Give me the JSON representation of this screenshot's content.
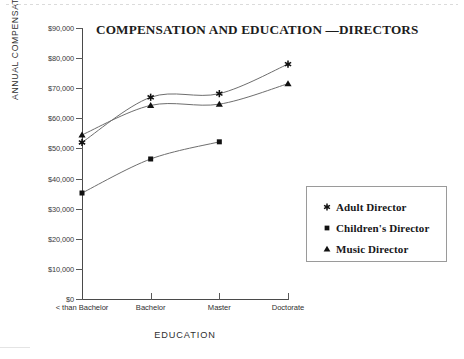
{
  "chart_data": {
    "type": "line",
    "title": "COMPENSATION AND EDUCATION —DIRECTORS",
    "xlabel": "EDUCATION",
    "ylabel": "ANNUAL COMPENSATION",
    "categories": [
      "< than Bachelor",
      "Bachelor",
      "Master",
      "Doctorate"
    ],
    "ylim": [
      0,
      90000
    ],
    "yticks": [
      0,
      10000,
      20000,
      30000,
      40000,
      50000,
      60000,
      70000,
      80000,
      90000
    ],
    "ytick_labels": [
      "$0",
      "$10,000",
      "$20,000",
      "$30,000",
      "$40,000",
      "$50,000",
      "$60,000",
      "$70,000",
      "$80,000",
      "$90,000"
    ],
    "grid": false,
    "legend_position": "right",
    "smoothed": true,
    "series": [
      {
        "name": "Adult Director",
        "marker": "star",
        "values": [
          52000,
          67000,
          68200,
          78000
        ]
      },
      {
        "name": "Children's Director",
        "marker": "square",
        "values": [
          35200,
          46500,
          52200,
          null
        ]
      },
      {
        "name": "Music Director",
        "marker": "triangle",
        "values": [
          54500,
          64300,
          64700,
          71500
        ]
      }
    ]
  },
  "legend": {
    "items": [
      {
        "label": "Adult Director",
        "marker": "star-marker-icon"
      },
      {
        "label": "Children's Director",
        "marker": "square-marker-icon"
      },
      {
        "label": "Music Director",
        "marker": "triangle-marker-icon"
      }
    ]
  },
  "colors": {
    "line": "#6e6e6e",
    "marker": "#111111",
    "axis": "#4a4a4a",
    "text": "#2f2f2f",
    "title": "#1c1c1c",
    "background": "#ffffff"
  }
}
